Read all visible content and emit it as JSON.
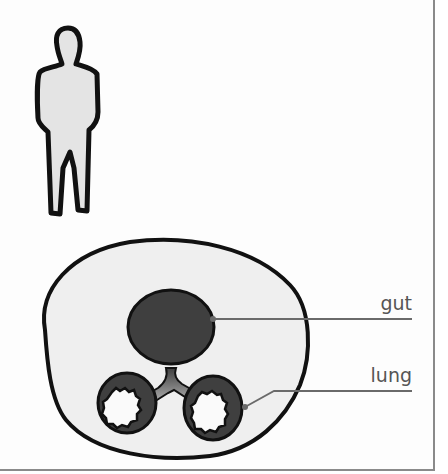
{
  "diagram": {
    "type": "anatomical-schematic",
    "figures": [
      {
        "name": "human-silhouette",
        "description": "standing adult human outline"
      },
      {
        "name": "body-cross-section",
        "description": "cross section of body showing gut connected to paired lungs"
      }
    ],
    "labels": {
      "gut": "gut",
      "lung": "lung"
    },
    "colors": {
      "outline": "#111111",
      "body_fill": "#efefef",
      "human_fill": "#e4e4e4",
      "organ_fill": "#3f3f3f",
      "leader_line": "#6a6a6a",
      "label_text": "#555555",
      "frame_border": "#8a8a8a"
    }
  }
}
